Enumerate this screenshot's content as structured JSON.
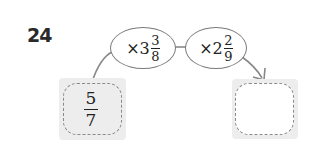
{
  "problem": {
    "number": "24",
    "start": {
      "numerator": "5",
      "denominator": "7"
    },
    "operations": [
      {
        "operator": "×",
        "whole": "3",
        "numerator": "3",
        "denominator": "8"
      },
      {
        "operator": "×",
        "whole": "2",
        "numerator": "2",
        "denominator": "9"
      }
    ],
    "answer": ""
  }
}
